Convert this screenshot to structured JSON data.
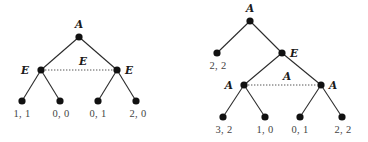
{
  "diagram": {
    "type": "extensive-form game trees",
    "colors": {
      "edge": "#2a2a2a",
      "node": "#111111",
      "info_set": "#555555",
      "player_label": "#1a1a1a",
      "payoff_label": "#444444"
    },
    "trees": [
      {
        "name": "left-tree",
        "root": {
          "player": "A"
        },
        "decision_nodes": [
          {
            "id": "E1",
            "player": "E",
            "label": "E"
          },
          {
            "id": "E2",
            "player": "E",
            "label": "E"
          }
        ],
        "information_set": {
          "members": [
            "E1",
            "E2"
          ],
          "label": "E"
        },
        "leaves": [
          {
            "parent": "E1",
            "payoff": "1, 1"
          },
          {
            "parent": "E1",
            "payoff": "0, 0"
          },
          {
            "parent": "E2",
            "payoff": "0, 1"
          },
          {
            "parent": "E2",
            "payoff": "2, 0"
          }
        ],
        "labels": {
          "root": "A",
          "left_E": "E",
          "right_E": "E",
          "info_set": "E",
          "payoffs": [
            "1, 1",
            "0, 0",
            "0, 1",
            "2, 0"
          ]
        }
      },
      {
        "name": "right-tree",
        "root": {
          "player": "A"
        },
        "decision_nodes": [
          {
            "id": "E",
            "player": "E",
            "label": "E"
          },
          {
            "id": "A1",
            "player": "A",
            "label": "A"
          },
          {
            "id": "A2",
            "player": "A",
            "label": "A"
          }
        ],
        "information_set": {
          "members": [
            "A1",
            "A2"
          ],
          "label": "A"
        },
        "leaves": [
          {
            "parent": "root",
            "payoff": "2, 2"
          },
          {
            "parent": "A1",
            "payoff": "3, 2"
          },
          {
            "parent": "A1",
            "payoff": "1, 0"
          },
          {
            "parent": "A2",
            "payoff": "0, 1"
          },
          {
            "parent": "A2",
            "payoff": "2, 2"
          }
        ],
        "labels": {
          "root": "A",
          "mid_E": "E",
          "left_A": "A",
          "right_A": "A",
          "info_set": "A",
          "early_payoff": "2, 2",
          "payoffs": [
            "3, 2",
            "1, 0",
            "0, 1",
            "2, 2"
          ]
        }
      }
    ]
  }
}
